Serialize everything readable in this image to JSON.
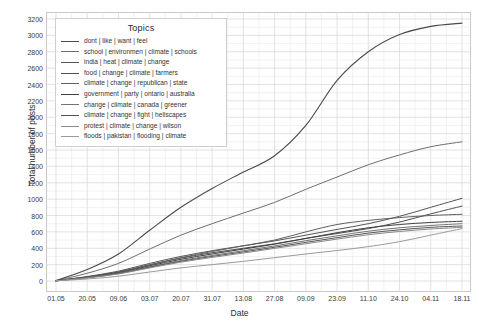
{
  "chart_data": {
    "type": "line",
    "title": "",
    "legend_title": "Topics",
    "legend_position": "top-left-inside",
    "grid": true,
    "xlabel": "Date",
    "ylabel": "Total number of posts",
    "ylim": [
      0,
      3200
    ],
    "yticks": [
      0,
      200,
      400,
      600,
      800,
      1000,
      1200,
      1400,
      1600,
      1800,
      2000,
      2200,
      2400,
      2600,
      2800,
      3000,
      3200
    ],
    "xticks": [
      "01.05",
      "20.05",
      "09.06",
      "03.07",
      "20.07",
      "31.07",
      "13.08",
      "27.08",
      "09.09",
      "23.09",
      "11.10",
      "24.10",
      "04.11",
      "18.11"
    ],
    "x": [
      0,
      1,
      2,
      3,
      4,
      5,
      6,
      7,
      8,
      9,
      10,
      11,
      12,
      13
    ],
    "series": [
      {
        "name": "dont | like | want | feel",
        "color": "#4a4a4a",
        "width": 1.1,
        "values": [
          5,
          140,
          330,
          620,
          900,
          1130,
          1330,
          1530,
          1900,
          2450,
          2800,
          3010,
          3110,
          3150
        ]
      },
      {
        "name": "school | environmen | climate | schools",
        "color": "#6e6e6e",
        "width": 1.0,
        "values": [
          4,
          95,
          215,
          390,
          560,
          700,
          830,
          960,
          1120,
          1270,
          1420,
          1540,
          1640,
          1700
        ]
      },
      {
        "name": "india | heat | climate | change",
        "color": "#555555",
        "width": 1.0,
        "values": [
          3,
          55,
          120,
          215,
          300,
          370,
          430,
          490,
          560,
          630,
          700,
          790,
          900,
          1010
        ]
      },
      {
        "name": "food | change | climate | farmers",
        "color": "#4f4f4f",
        "width": 1.0,
        "values": [
          3,
          50,
          110,
          200,
          280,
          345,
          400,
          455,
          520,
          580,
          640,
          720,
          820,
          915
        ]
      },
      {
        "name": "climate | change | republican | state",
        "color": "#606060",
        "width": 1.0,
        "values": [
          3,
          48,
          105,
          195,
          285,
          360,
          430,
          500,
          600,
          690,
          740,
          775,
          800,
          815
        ]
      },
      {
        "name": "government | party | ontario | australia",
        "color": "#3f3f3f",
        "width": 1.0,
        "values": [
          3,
          45,
          100,
          185,
          265,
          330,
          390,
          450,
          520,
          590,
          650,
          690,
          715,
          730
        ]
      },
      {
        "name": "change | climate | canada | greener",
        "color": "#737373",
        "width": 1.0,
        "values": [
          2,
          42,
          95,
          175,
          250,
          312,
          370,
          428,
          492,
          552,
          608,
          650,
          678,
          700
        ]
      },
      {
        "name": "climate | change | fight | hellscapes",
        "color": "#565656",
        "width": 1.0,
        "values": [
          2,
          40,
          90,
          168,
          240,
          300,
          355,
          412,
          472,
          530,
          585,
          625,
          655,
          672
        ]
      },
      {
        "name": "protest | climate | change | wilson",
        "color": "#8a8a8a",
        "width": 1.0,
        "values": [
          2,
          38,
          86,
          160,
          230,
          288,
          342,
          398,
          455,
          512,
          565,
          605,
          635,
          655
        ]
      },
      {
        "name": "floods | pakistan | flooding | climate",
        "color": "#9b9b9b",
        "width": 1.0,
        "values": [
          2,
          25,
          58,
          110,
          160,
          200,
          240,
          285,
          330,
          372,
          420,
          480,
          560,
          640
        ]
      }
    ]
  }
}
